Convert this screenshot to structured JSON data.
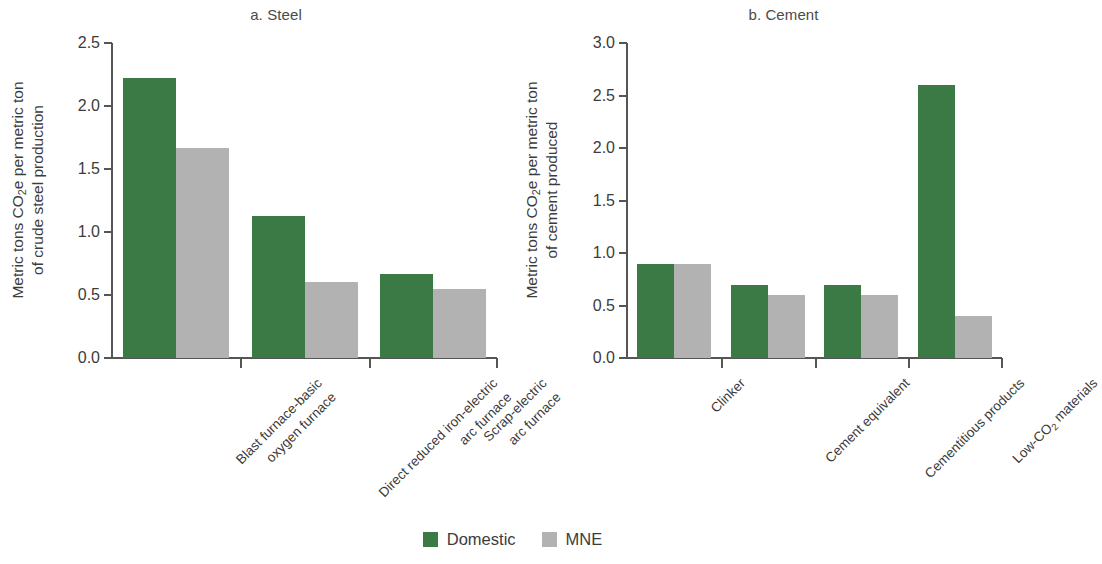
{
  "legend": {
    "position": "bottom-center",
    "entries": [
      {
        "label": "Domestic",
        "color": "#3b7a45",
        "key": "domestic"
      },
      {
        "label": "MNE",
        "color": "#b2b2b2",
        "key": "mne"
      }
    ]
  },
  "chart_data": [
    {
      "type": "bar",
      "panel": "a",
      "title": "a. Steel",
      "xlabel": "",
      "ylabel": "Metric tons CO2e per metric ton of crude steel production",
      "ylabel_line1": "Metric tons CO",
      "ylabel_line1_sub": "2",
      "ylabel_line1_rest": "e per metric ton",
      "ylabel_line2": "of crude steel production",
      "ylim": [
        0,
        2.5
      ],
      "yticks": [
        0.0,
        0.5,
        1.0,
        1.5,
        2.0,
        2.5
      ],
      "ytick_labels": [
        "0.0",
        "0.5",
        "1.0",
        "1.5",
        "2.0",
        "2.5"
      ],
      "grid": false,
      "categories": [
        "Blast furnace-basic oxygen furnace",
        "Direct reduced iron-electric arc furnace",
        "Scrap-electric arc furnace"
      ],
      "category_lines": [
        [
          "Blast furnace-basic",
          "oxygen furnace"
        ],
        [
          "Direct reduced iron-electric",
          "arc furnace"
        ],
        [
          "Scrap-electric",
          "arc furnace"
        ]
      ],
      "series": [
        {
          "name": "Domestic",
          "color": "#3b7a45",
          "values": [
            2.22,
            1.13,
            0.67
          ]
        },
        {
          "name": "MNE",
          "color": "#b2b2b2",
          "values": [
            1.67,
            0.6,
            0.55
          ]
        }
      ]
    },
    {
      "type": "bar",
      "panel": "b",
      "title": "b. Cement",
      "xlabel": "",
      "ylabel": "Metric tons CO2e per metric ton of cement produced",
      "ylabel_line1": "Metric tons CO",
      "ylabel_line1_sub": "2",
      "ylabel_line1_rest": "e per metric ton",
      "ylabel_line2": "of cement produced",
      "ylim": [
        0,
        3.0
      ],
      "yticks": [
        0.0,
        0.5,
        1.0,
        1.5,
        2.0,
        2.5,
        3.0
      ],
      "ytick_labels": [
        "0.0",
        "0.5",
        "1.0",
        "1.5",
        "2.0",
        "2.5",
        "3.0"
      ],
      "grid": false,
      "categories": [
        "Clinker",
        "Cement equivalent",
        "Cementitious products",
        "Low-CO2 materials"
      ],
      "category_lines": [
        [
          "Clinker"
        ],
        [
          "Cement equivalent"
        ],
        [
          "Cementitious products"
        ],
        [
          "Low-CO2 materials"
        ]
      ],
      "series": [
        {
          "name": "Domestic",
          "color": "#3b7a45",
          "values": [
            0.9,
            0.7,
            0.7,
            2.6
          ]
        },
        {
          "name": "MNE",
          "color": "#b2b2b2",
          "values": [
            0.9,
            0.6,
            0.6,
            0.4
          ]
        }
      ]
    }
  ]
}
